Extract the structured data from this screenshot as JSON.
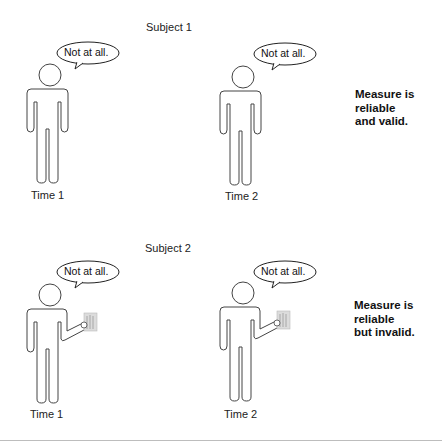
{
  "panels": [
    {
      "subject_label": "Subject 1",
      "figures": [
        {
          "speech": "Not at all.",
          "time_label": "Time 1",
          "holding_object": false
        },
        {
          "speech": "Not at all.",
          "time_label": "Time 2",
          "holding_object": false
        }
      ],
      "verdict": [
        "Measure is",
        "reliable",
        "and valid."
      ]
    },
    {
      "subject_label": "Subject 2",
      "figures": [
        {
          "speech": "Not at all.",
          "time_label": "Time 1",
          "holding_object": true
        },
        {
          "speech": "Not at all.",
          "time_label": "Time 2",
          "holding_object": true
        }
      ],
      "verdict": [
        "Measure is",
        "reliable",
        "but invalid."
      ]
    }
  ],
  "colors": {
    "outline": "#444444",
    "background": "#ffffff",
    "object_fill": "#d9d9d9"
  }
}
